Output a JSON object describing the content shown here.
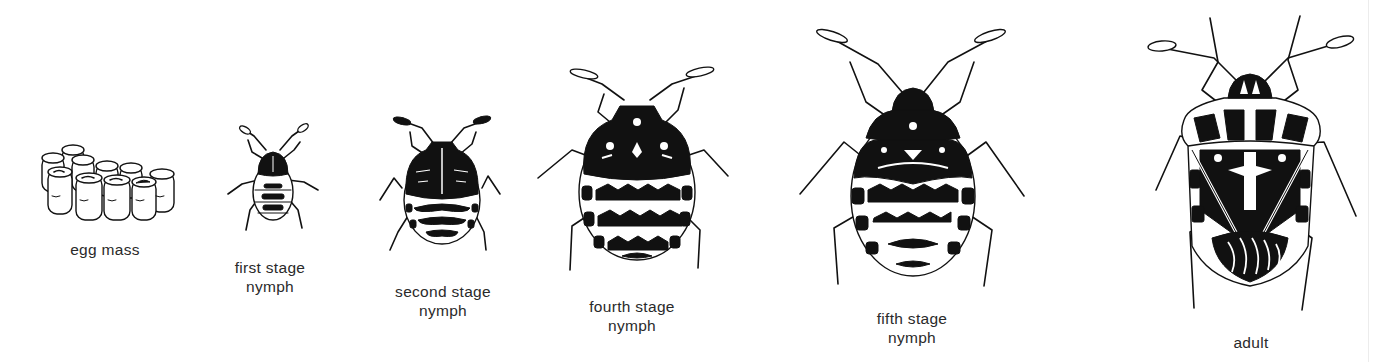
{
  "figure": {
    "ink_color": "#111111",
    "background": "#ffffff",
    "stages": [
      {
        "id": "egg-mass",
        "label_lines": [
          "egg mass"
        ],
        "label_center_x": 105,
        "label_top": 240
      },
      {
        "id": "first-stage-nymph",
        "label_lines": [
          "first stage",
          "nymph"
        ],
        "label_center_x": 270,
        "label_top": 258
      },
      {
        "id": "second-stage-nymph",
        "label_lines": [
          "second stage",
          "nymph"
        ],
        "label_center_x": 443,
        "label_top": 282
      },
      {
        "id": "fourth-stage-nymph",
        "label_lines": [
          "fourth stage",
          "nymph"
        ],
        "label_center_x": 632,
        "label_top": 297
      },
      {
        "id": "fifth-stage-nymph",
        "label_lines": [
          "fifth stage",
          "nymph"
        ],
        "label_center_x": 912,
        "label_top": 309
      },
      {
        "id": "adult",
        "label_lines": [
          "adult"
        ],
        "label_center_x": 1251,
        "label_top": 333
      }
    ]
  }
}
